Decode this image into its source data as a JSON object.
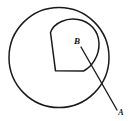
{
  "figure": {
    "background_color": "#ffffff",
    "stroke_color": "#1a1a1a",
    "width": 128,
    "height": 121,
    "labels": {
      "inner_point": "B",
      "outer_point": "A"
    },
    "shapes": {
      "outer_boundary": {
        "name": "outer-circle",
        "type": "circle",
        "center_x": 59,
        "center_y": 57.5,
        "radius": 50
      },
      "inner_boundary": {
        "name": "inner-region",
        "type": "closed-curve",
        "description": "D-shaped region: rounded arc on top and right, straight edge on lower-left, flat bottom edge"
      },
      "segment": {
        "name": "segment-b-to-a",
        "type": "line",
        "from_label": "B",
        "to_label": "A",
        "x1": 81,
        "y1": 47,
        "x2": 117,
        "y2": 110
      }
    },
    "label_positions": {
      "B": {
        "x": 77,
        "y": 42
      },
      "A": {
        "x": 121,
        "y": 113
      }
    }
  }
}
